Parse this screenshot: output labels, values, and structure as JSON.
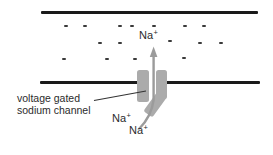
{
  "diagram": {
    "channel_label": {
      "line1": "voltage gated",
      "line2": "sodium channel"
    },
    "ion": {
      "symbol": "Na",
      "charge": "+"
    },
    "minus_charges": {
      "glyph": "-",
      "positions": [
        [
          64,
          25
        ],
        [
          83,
          25
        ],
        [
          118,
          25
        ],
        [
          130,
          25
        ],
        [
          152,
          25
        ],
        [
          183,
          25
        ],
        [
          202,
          25
        ],
        [
          98,
          42
        ],
        [
          118,
          42
        ],
        [
          168,
          40
        ],
        [
          198,
          42
        ],
        [
          219,
          42
        ],
        [
          62,
          58
        ],
        [
          105,
          58
        ],
        [
          133,
          58
        ],
        [
          182,
          57
        ]
      ]
    },
    "colors": {
      "membrane": "#1a1a1a",
      "channel": "#ababab",
      "arrow": "#9b9b9b",
      "text": "#2b2b2b"
    }
  }
}
